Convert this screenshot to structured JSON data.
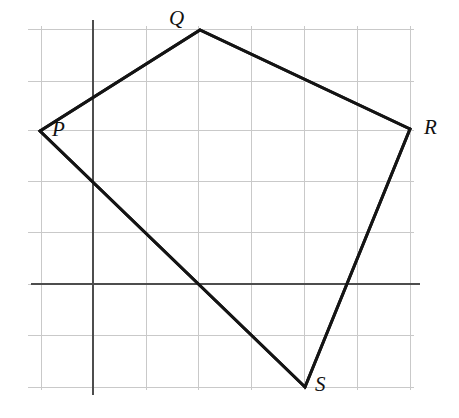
{
  "figure": {
    "type": "geometry-quadrilateral-on-grid",
    "canvas": {
      "width": 459,
      "height": 418
    },
    "background_color": "#ffffff",
    "grid": {
      "visible": true,
      "line_color": "#c9c9c9",
      "line_width": 1,
      "spacing_px": 52,
      "x_lines": [
        41,
        93,
        146,
        198,
        251,
        304,
        357,
        410
      ],
      "y_lines": [
        29,
        81,
        130,
        181,
        232,
        284,
        335,
        387
      ],
      "extent": {
        "left": 28,
        "right": 414,
        "top": 26,
        "bottom": 390
      }
    },
    "axes": {
      "color": "#4d4d4d",
      "line_width": 2,
      "x_axis": {
        "name": "x-axis",
        "y": 284,
        "x_start": 31,
        "x_end": 420
      },
      "y_axis": {
        "name": "y-axis",
        "x": 93,
        "y_start": 20,
        "y_end": 395
      },
      "origin": {
        "x": 93,
        "y": 284
      }
    },
    "shape": {
      "name": "quadrilateral-PQRS",
      "stroke_color": "#141414",
      "stroke_width": 3,
      "fill": "none",
      "closed": true,
      "vertices": [
        {
          "id": "P",
          "label": "P",
          "x": 40,
          "y": 131,
          "label_x": 52,
          "label_y": 119
        },
        {
          "id": "Q",
          "label": "Q",
          "x": 200,
          "y": 30,
          "label_x": 169,
          "label_y": 8
        },
        {
          "id": "R",
          "label": "R",
          "x": 410,
          "y": 129,
          "label_x": 424,
          "label_y": 117
        },
        {
          "id": "S",
          "label": "S",
          "x": 305,
          "y": 387,
          "label_x": 315,
          "label_y": 374
        }
      ],
      "edges": [
        {
          "from": "P",
          "to": "Q"
        },
        {
          "from": "Q",
          "to": "R"
        },
        {
          "from": "R",
          "to": "S"
        },
        {
          "from": "S",
          "to": "P"
        }
      ]
    }
  }
}
